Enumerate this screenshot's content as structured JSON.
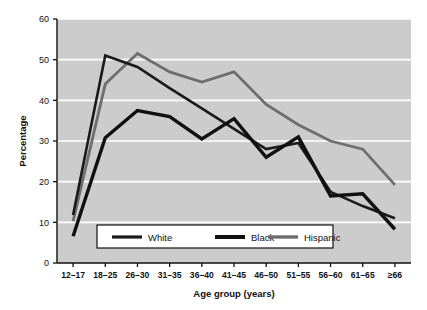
{
  "chart_data": {
    "type": "line",
    "title": "",
    "xlabel": "Age group (years)",
    "ylabel": "Percentage",
    "ylim": [
      0,
      60
    ],
    "yticks": [
      0,
      10,
      20,
      30,
      40,
      50,
      60
    ],
    "grid": true,
    "legend_position": "bottom-center",
    "categories": [
      "12–17",
      "18–25",
      "26–30",
      "31–35",
      "36–40",
      "41–45",
      "46–50",
      "51–55",
      "56–60",
      "61–65",
      "≥66"
    ],
    "series": [
      {
        "name": "White",
        "color": "#1a1a1a",
        "width": 2.6,
        "values": [
          11.8,
          51.0,
          48.2,
          43.0,
          38.0,
          33.0,
          28.0,
          29.5,
          17.5,
          14.0,
          11.0
        ]
      },
      {
        "name": "Black",
        "color": "#101010",
        "width": 3.4,
        "values": [
          6.6,
          30.8,
          37.5,
          36.0,
          30.5,
          35.5,
          26.0,
          31.0,
          16.5,
          17.0,
          8.3
        ]
      },
      {
        "name": "Hispanic",
        "color": "#6e6e6e",
        "width": 2.8,
        "values": [
          10.3,
          44.0,
          51.5,
          47.0,
          44.5,
          47.0,
          39.0,
          34.0,
          30.0,
          28.0,
          19.2
        ]
      }
    ]
  },
  "legend": {
    "items": [
      {
        "label": "White"
      },
      {
        "label": "Black"
      },
      {
        "label": "Hispanic"
      }
    ]
  },
  "style": {
    "plot_background": "#cccccc",
    "gridline_color": "#ffffff",
    "axis_color": "#111111",
    "page_background": "#ffffff"
  }
}
